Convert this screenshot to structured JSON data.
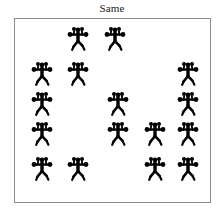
{
  "title": "Same",
  "panel": {
    "background_color": "#ffffff",
    "border_color": "#8c8c8c",
    "x": 14,
    "y": 18,
    "width": 197,
    "height": 185
  },
  "figure": {
    "icon_name": "juggler-figure-icon",
    "color": "#000000",
    "ball_count": 4,
    "width": 22,
    "height": 27
  },
  "figures": {
    "count": 16,
    "all_identical": true,
    "rows": [
      {
        "row": 1,
        "y": 38,
        "xs": [
          78,
          115
        ]
      },
      {
        "row": 2,
        "y": 73,
        "xs": [
          42,
          78,
          188
        ]
      },
      {
        "row": 3,
        "y": 103,
        "xs": [
          42,
          118,
          188
        ]
      },
      {
        "row": 4,
        "y": 133,
        "xs": [
          42,
          118,
          155,
          188
        ]
      },
      {
        "row": 5,
        "y": 168,
        "xs": [
          42,
          78,
          155,
          188
        ]
      }
    ]
  }
}
